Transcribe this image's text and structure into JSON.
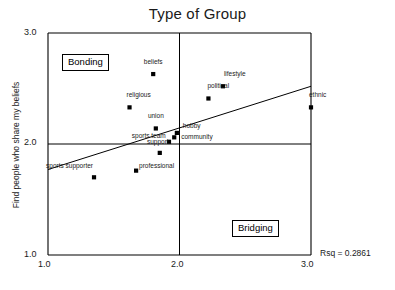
{
  "chart_data": {
    "type": "scatter",
    "title": "Type of Group",
    "xlabel": "",
    "ylabel": "Find people who share my beliefs",
    "xlim": [
      1.0,
      3.0
    ],
    "ylim": [
      1.0,
      3.0
    ],
    "xticks": [
      "1.0",
      "2.0",
      "3.0"
    ],
    "yticks": [
      "3.0",
      "2.0",
      "1.0"
    ],
    "grid": false,
    "reference_lines": {
      "vertical_x": 2.0,
      "horizontal_y": 2.0
    },
    "annotations": {
      "quadrant_upper_left": "Bonding",
      "quadrant_lower_right": "Bridging",
      "fit_statistic": "Rsq = 0.2861"
    },
    "fit_line": {
      "x": [
        1.0,
        3.0
      ],
      "y": [
        1.77,
        2.52
      ]
    },
    "points": [
      {
        "label": "beliefs",
        "x": 1.8,
        "y": 2.63,
        "label_dx": 0,
        "label_dy": -9
      },
      {
        "label": "lifestyle",
        "x": 2.33,
        "y": 2.52,
        "label_dx": 1,
        "label_dy": -9
      },
      {
        "label": "political",
        "x": 2.22,
        "y": 2.41,
        "label_dx": -1,
        "label_dy": -9
      },
      {
        "label": "religious",
        "x": 1.62,
        "y": 2.33,
        "label_dx": -3,
        "label_dy": -9
      },
      {
        "label": "ethnic",
        "x": 3.0,
        "y": 2.33,
        "label_dx": -2,
        "label_dy": -9
      },
      {
        "label": "union",
        "x": 1.82,
        "y": 2.14,
        "label_dx": 0,
        "label_dy": -9
      },
      {
        "label": "hobby",
        "x": 1.98,
        "y": 2.1,
        "label_dx": 6,
        "label_dy": -4
      },
      {
        "label": "community",
        "x": 1.96,
        "y": 2.06,
        "label_dx": 7,
        "label_dy": 3
      },
      {
        "label": "support",
        "x": 1.92,
        "y": 2.02,
        "label_dx": -22,
        "label_dy": 3
      },
      {
        "label": "sports team",
        "x": 1.85,
        "y": 1.92,
        "label_dx": -28,
        "label_dy": -14
      },
      {
        "label": "professional",
        "x": 1.67,
        "y": 1.76,
        "label_dx": 3,
        "label_dy": -2
      },
      {
        "label": "sports supporter",
        "x": 1.35,
        "y": 1.7,
        "label_dx": -48,
        "label_dy": -8
      }
    ]
  },
  "figure": {
    "title": "Type of Group",
    "y_axis_label": "Find people who share my beliefs",
    "rsq_text": "Rsq = 0.2861",
    "bonding_label": "Bonding",
    "bridging_label": "Bridging",
    "tick_x_1": "1.0",
    "tick_x_2": "2.0",
    "tick_x_3": "3.0",
    "tick_y_1": "1.0",
    "tick_y_2": "2.0",
    "tick_y_3": "3.0"
  },
  "colors": {
    "axis": "#000000",
    "marker": "#000000",
    "text": "#1a1a1a",
    "background": "#ffffff"
  }
}
